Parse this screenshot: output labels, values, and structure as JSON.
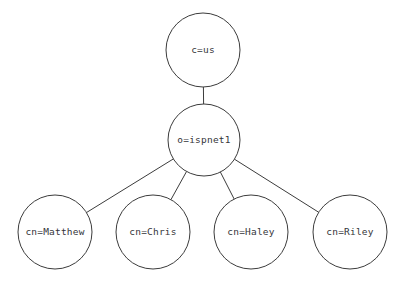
{
  "diagram": {
    "type": "tree",
    "background_color": "#ffffff",
    "stroke_color": "#3c3c3c",
    "label_color": "#35353a",
    "canvas": {
      "width": 408,
      "height": 285
    },
    "nodes": [
      {
        "id": "root",
        "label": "c=us",
        "level": 0,
        "cx": 203,
        "cy": 50,
        "r": 37
      },
      {
        "id": "org",
        "label": "o=ispnet1",
        "level": 1,
        "cx": 204,
        "cy": 140,
        "r": 36
      },
      {
        "id": "leaf-matthew",
        "label": "cn=Matthew",
        "level": 2,
        "cx": 55,
        "cy": 232,
        "r": 37
      },
      {
        "id": "leaf-chris",
        "label": "cn=Chris",
        "level": 2,
        "cx": 153,
        "cy": 232,
        "r": 37
      },
      {
        "id": "leaf-haley",
        "label": "cn=Haley",
        "level": 2,
        "cx": 251,
        "cy": 232,
        "r": 37
      },
      {
        "id": "leaf-riley",
        "label": "cn=Riley",
        "level": 2,
        "cx": 350,
        "cy": 232,
        "r": 37
      }
    ],
    "edges": [
      {
        "id": "edge-root-org",
        "from": "root",
        "to": "org"
      },
      {
        "id": "edge-org-matthew",
        "from": "org",
        "to": "leaf-matthew"
      },
      {
        "id": "edge-org-chris",
        "from": "org",
        "to": "leaf-chris"
      },
      {
        "id": "edge-org-haley",
        "from": "org",
        "to": "leaf-haley"
      },
      {
        "id": "edge-org-riley",
        "from": "org",
        "to": "leaf-riley"
      }
    ]
  }
}
